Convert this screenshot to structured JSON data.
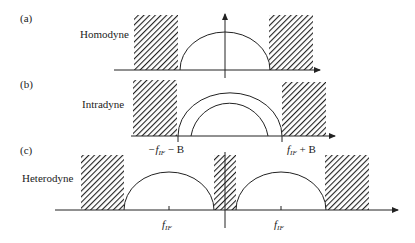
{
  "panels": [
    {
      "id": "a",
      "tag": "(a)",
      "label": "Homodyne"
    },
    {
      "id": "b",
      "tag": "(b)",
      "label": "Intradyne",
      "annotations": {
        "left": {
          "f": "−f",
          "sub": "IF",
          "rest": " − B"
        },
        "right": {
          "f": "f",
          "sub": "IF",
          "rest": " + B"
        }
      }
    },
    {
      "id": "c",
      "tag": "(c)",
      "label": "Heterodyne",
      "annotations": {
        "left": {
          "f": "f",
          "sub": "IF"
        },
        "right": {
          "f": "f",
          "sub": "IF"
        }
      }
    }
  ],
  "colors": {
    "line": "#222222",
    "hatch": "#222222",
    "background": "#ffffff"
  }
}
